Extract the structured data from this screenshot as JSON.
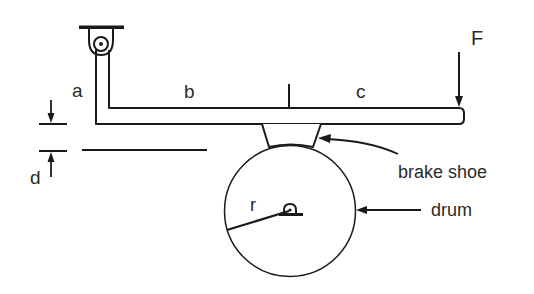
{
  "diagram": {
    "type": "mechanical-schematic",
    "labels": {
      "a": "a",
      "b": "b",
      "c": "c",
      "d": "d",
      "F": "F",
      "r": "r",
      "brake_shoe": "brake shoe",
      "drum": "drum"
    },
    "colors": {
      "stroke": "#1a1a1a",
      "background": "#ffffff",
      "text": "#2a2a2a"
    }
  }
}
